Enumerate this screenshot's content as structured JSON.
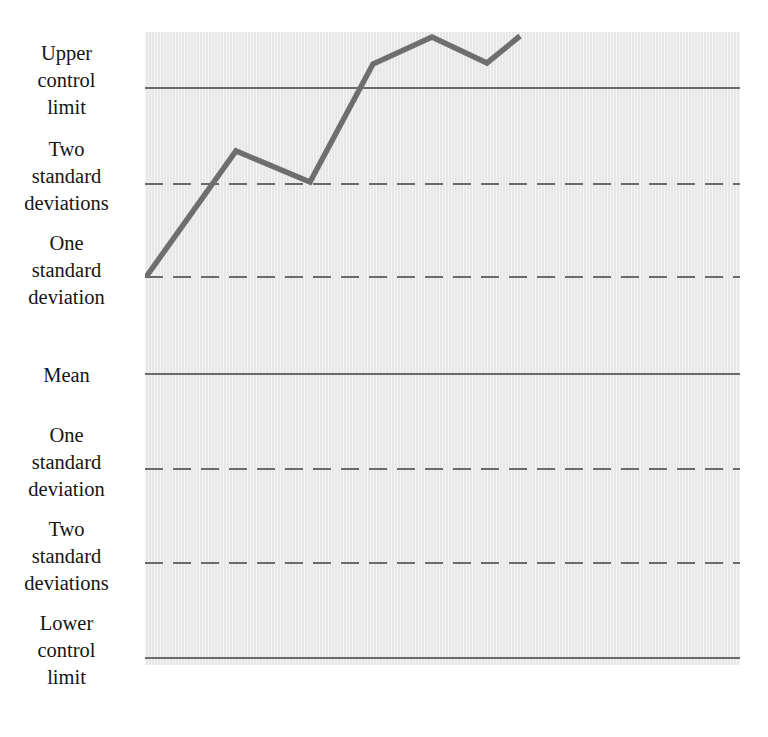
{
  "chart_data": {
    "type": "line",
    "title": "",
    "subtitle": "",
    "xlabel": "",
    "ylabel": "",
    "grid": false,
    "legend_position": "none",
    "x": [
      1,
      2,
      3,
      4,
      5,
      6,
      7
    ],
    "series": [
      {
        "name": "Sample measurement",
        "color": "#6e6e6e",
        "values": [
          1.0,
          2.35,
          1.98,
          3.25,
          3.54,
          3.26,
          3.55
        ]
      }
    ],
    "ylim": [
      -3.5,
      3.8
    ],
    "reference_lines": [
      {
        "id": "ucl",
        "label": "Upper control limit",
        "value": 3.0,
        "style": "solid",
        "y_px": 88
      },
      {
        "id": "two-sigma-up",
        "label": "Two standard deviations",
        "value": 2.0,
        "style": "dashed",
        "y_px": 184
      },
      {
        "id": "one-sigma-up",
        "label": "One standard deviation",
        "value": 1.0,
        "style": "dashed",
        "y_px": 277
      },
      {
        "id": "mean",
        "label": "Mean",
        "value": 0.0,
        "style": "solid",
        "y_px": 374
      },
      {
        "id": "one-sigma-dn",
        "label": "One standard deviation",
        "value": -1.0,
        "style": "dashed",
        "y_px": 469
      },
      {
        "id": "two-sigma-dn",
        "label": "Two standard deviations",
        "value": -2.0,
        "style": "dashed",
        "y_px": 563
      },
      {
        "id": "lcl",
        "label": "Lower control limit",
        "value": -3.0,
        "style": "solid",
        "y_px": 658
      }
    ],
    "data_points_px": [
      {
        "x": 146,
        "y": 277
      },
      {
        "x": 236,
        "y": 151
      },
      {
        "x": 310,
        "y": 182
      },
      {
        "x": 373,
        "y": 64
      },
      {
        "x": 432,
        "y": 37
      },
      {
        "x": 487,
        "y": 63
      },
      {
        "x": 520,
        "y": 36
      }
    ]
  },
  "labels": {
    "upper_control_limit": "Upper\ncontrol\nlimit",
    "two_standard_deviations_upper": "Two\nstandard\ndeviations",
    "one_standard_deviation_upper": "One\nstandard\ndeviation",
    "mean": "Mean",
    "one_standard_deviation_lower": "One\nstandard\ndeviation",
    "two_standard_deviations_lower": "Two\nstandard\ndeviations",
    "lower_control_limit": "Lower\ncontrol\nlimit"
  },
  "colors": {
    "plot_background": "#e7e7e7",
    "page_background": "#ffffff",
    "reference_line": "#6a6a6a",
    "data_line": "#6e6e6e",
    "label_text": "#151515"
  }
}
